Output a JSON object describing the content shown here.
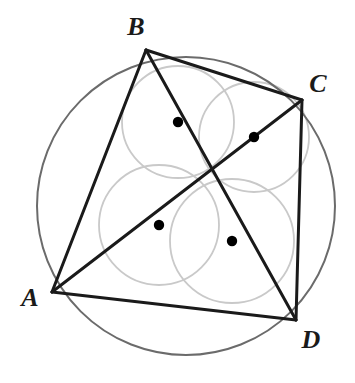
{
  "figure": {
    "canvas": {
      "width": 355,
      "height": 383,
      "background": "#ffffff"
    },
    "colors": {
      "stroke_dark": "#1a1a1a",
      "stroke_circumcircle": "#6b6b6b",
      "stroke_incircle": "#c9c9c9",
      "dot_fill": "#000000",
      "label_fill": "#1a1a1a"
    },
    "circumcircle": {
      "name": "circumcircle",
      "cx": 186,
      "cy": 206,
      "r": 149,
      "stroke_width": 2.0
    },
    "vertices": [
      {
        "id": "A",
        "label": "A",
        "x": 52,
        "y": 292,
        "label_x": 30,
        "label_y": 306
      },
      {
        "id": "B",
        "label": "B",
        "x": 146,
        "y": 50,
        "label_x": 136,
        "label_y": 35
      },
      {
        "id": "C",
        "label": "C",
        "x": 302,
        "y": 100,
        "label_x": 318,
        "label_y": 92
      },
      {
        "id": "D",
        "label": "D",
        "x": 296,
        "y": 320,
        "label_x": 311,
        "label_y": 348
      }
    ],
    "sides": [
      {
        "name": "side-AB",
        "from": "A",
        "to": "B"
      },
      {
        "name": "side-BC",
        "from": "B",
        "to": "C"
      },
      {
        "name": "side-CD",
        "from": "C",
        "to": "D"
      },
      {
        "name": "side-DA",
        "from": "D",
        "to": "A"
      }
    ],
    "diagonals": [
      {
        "name": "diagonal-AC",
        "from": "A",
        "to": "C"
      },
      {
        "name": "diagonal-BD",
        "from": "B",
        "to": "D"
      }
    ],
    "diagonal_intersection": {
      "name": "diagonal-intersection",
      "x": 208,
      "y": 175
    },
    "incircles": [
      {
        "name": "incircle-ABC",
        "triangle": "ABC",
        "center_x": 178,
        "center_y": 122,
        "r": 56,
        "dot_r": 5.2
      },
      {
        "name": "incircle-BCD",
        "triangle": "BCD",
        "center_x": 254,
        "center_y": 137,
        "r": 55,
        "dot_r": 5.2
      },
      {
        "name": "incircle-ABD",
        "triangle": "ABD",
        "center_x": 159,
        "center_y": 225,
        "r": 60,
        "dot_r": 5.2
      },
      {
        "name": "incircle-ACD",
        "triangle": "ACD",
        "center_x": 232,
        "center_y": 241,
        "r": 62,
        "dot_r": 5.2
      }
    ],
    "stroke_widths": {
      "side": 3.0,
      "diagonal": 3.0,
      "incircle": 1.8
    }
  }
}
